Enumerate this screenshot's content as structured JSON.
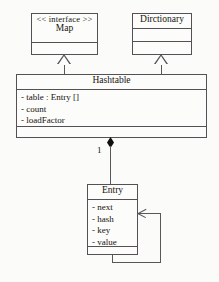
{
  "diagram": {
    "classes": [
      {
        "id": "map",
        "stereotype": "<< interface >>",
        "name": "Map",
        "attributes": [],
        "operations": []
      },
      {
        "id": "dictionary",
        "stereotype": "",
        "name": "Dirctionary",
        "attributes": [],
        "operations": []
      },
      {
        "id": "hashtable",
        "stereotype": "",
        "name": "Hashtable",
        "attributes": [
          "- table  :  Entry []",
          "- count",
          "- loadFactor"
        ],
        "operations": []
      },
      {
        "id": "entry",
        "stereotype": "",
        "name": "Entry",
        "attributes": [
          "- next",
          "- hash",
          "- key",
          "- value"
        ],
        "operations": []
      }
    ],
    "relationships": [
      {
        "id": "rel-hashtable-map",
        "type": "generalization",
        "from": "Hashtable",
        "to": "Map",
        "label": ""
      },
      {
        "id": "rel-hashtable-dictionary",
        "type": "generalization",
        "from": "Hashtable",
        "to": "Dirctionary",
        "label": ""
      },
      {
        "id": "rel-hashtable-entry",
        "type": "composition",
        "from": "Hashtable",
        "to": "Entry",
        "label": "1"
      },
      {
        "id": "rel-entry-entry",
        "type": "association",
        "from": "Entry",
        "to": "Entry",
        "label": ""
      }
    ],
    "multiplicity_hashtable_entry": "1",
    "colors": {
      "line": "#555055",
      "text": "#15130f",
      "fill": "#fcfcfb",
      "background": "#fbfbfa",
      "diamond": "#100f0d"
    }
  }
}
